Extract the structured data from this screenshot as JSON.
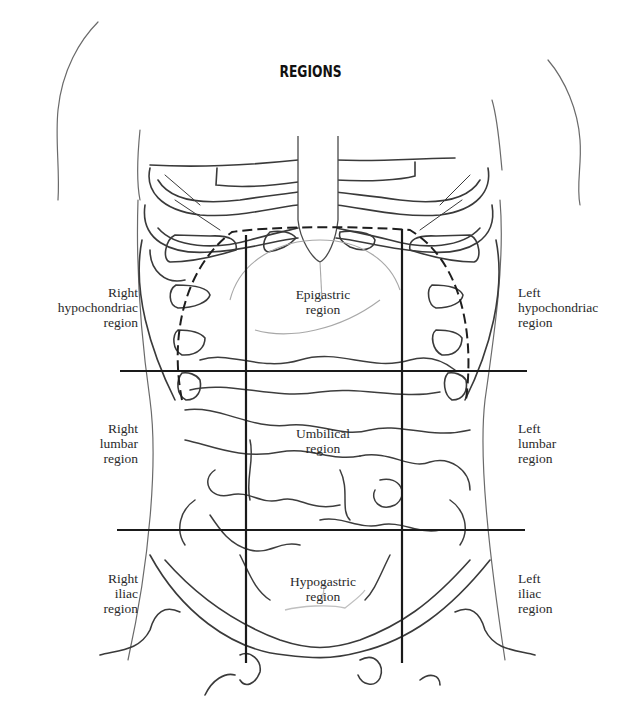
{
  "title": "REGIONS",
  "regions": {
    "right_hypochondriac": {
      "lines": [
        "Right",
        "hypochondriac",
        "region"
      ]
    },
    "epigastric": {
      "lines": [
        "Epigastric",
        "region"
      ]
    },
    "left_hypochondriac": {
      "lines": [
        "Left",
        "hypochondriac",
        "region"
      ]
    },
    "right_lumbar": {
      "lines": [
        "Right",
        "lumbar",
        "region"
      ]
    },
    "umbilical": {
      "lines": [
        "Umbilical",
        "region"
      ]
    },
    "left_lumbar": {
      "lines": [
        "Left",
        "lumbar",
        "region"
      ]
    },
    "right_iliac": {
      "lines": [
        "Right",
        "iliac",
        "region"
      ]
    },
    "hypogastric": {
      "lines": [
        "Hypogastric",
        "region"
      ]
    },
    "left_iliac": {
      "lines": [
        "Left",
        "iliac",
        "region"
      ]
    }
  },
  "colors": {
    "stroke": "#3a3a3a",
    "grid": "#222222",
    "faint": "#9a9a9a",
    "background": "#ffffff"
  }
}
